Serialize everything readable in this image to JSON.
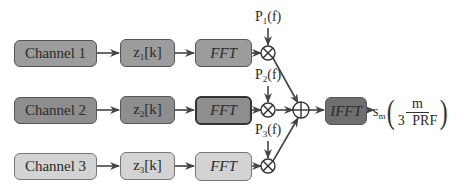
{
  "diagram": {
    "type": "signal-processing-block-diagram",
    "rows": [
      {
        "channel": "Channel 1",
        "sequence": {
          "base": "z",
          "sub": "1",
          "arg": "[k]"
        },
        "transform": "FFT",
        "weight": {
          "base": "P",
          "sub": "1",
          "arg": "(f)"
        },
        "fill": "#9c9c9c"
      },
      {
        "channel": "Channel 2",
        "sequence": {
          "base": "z",
          "sub": "2",
          "arg": "[k]"
        },
        "transform": "FFT",
        "weight": {
          "base": "P",
          "sub": "2",
          "arg": "(f)"
        },
        "fill": "#8e8e8e"
      },
      {
        "channel": "Channel 3",
        "sequence": {
          "base": "z",
          "sub": "3",
          "arg": "[k]"
        },
        "transform": "FFT",
        "weight": {
          "base": "P",
          "sub": "3",
          "arg": "(f)"
        },
        "fill": "#d3d3d3"
      }
    ],
    "multiplier_symbol": "⊗",
    "summer_symbol": "⊕",
    "inverse_transform": {
      "label": "IFFT",
      "fill": "#6f6f6f"
    },
    "output": {
      "base": "s",
      "sub": "m",
      "numerator": "m",
      "denominator": "3 PRF",
      "open": "(",
      "close": ")"
    }
  }
}
